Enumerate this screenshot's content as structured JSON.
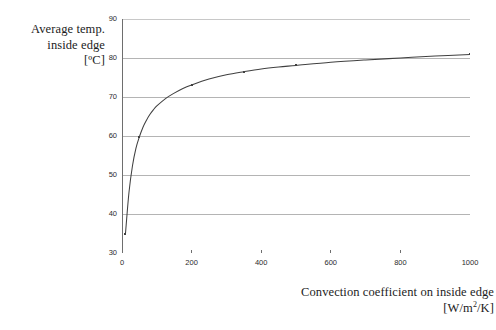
{
  "chart_data": {
    "type": "line",
    "title": "",
    "subtitle": "",
    "xlabel_lines": [
      "Convection coefficient on inside edge",
      "[W/m/K]"
    ],
    "xlabel_unit_numerator": "W/m",
    "xlabel_unit_exponent": "2",
    "xlabel_unit_denominator": "/K]",
    "ylabel_lines": [
      "Average temp.",
      "inside edge",
      "[ºC]"
    ],
    "xlim": [
      0,
      1000
    ],
    "ylim": [
      30,
      90
    ],
    "xticks": [
      0,
      200,
      400,
      600,
      800,
      1000
    ],
    "xtick_labels": [
      "0",
      "200",
      "400",
      "600",
      "800",
      "1000"
    ],
    "yticks": [
      30,
      40,
      50,
      60,
      70,
      80,
      90
    ],
    "ytick_labels": [
      "30",
      "40",
      "50",
      "60",
      "70",
      "80",
      "90"
    ],
    "grid": "horizontal",
    "legend": "none",
    "series": [
      {
        "name": "Average temp. inside edge",
        "color": "#404040",
        "marker": "small-dot",
        "x": [
          10,
          20,
          30,
          40,
          50,
          60,
          70,
          80,
          90,
          100,
          125,
          150,
          175,
          200,
          250,
          300,
          350,
          400,
          450,
          500,
          600,
          700,
          800,
          900,
          1000
        ],
        "y": [
          35.0,
          45.5,
          52.3,
          56.8,
          59.8,
          62.2,
          64.0,
          65.5,
          66.7,
          67.7,
          69.6,
          71.0,
          72.2,
          73.1,
          74.6,
          75.7,
          76.5,
          77.2,
          77.7,
          78.1,
          78.9,
          79.5,
          80.0,
          80.5,
          80.9
        ]
      }
    ],
    "annotations": []
  },
  "axes": {
    "y_title": {
      "line1": "Average temp.",
      "line2": "inside edge",
      "line3": "[ºC]"
    },
    "x_title": {
      "line1": "Convection coefficient on inside edge",
      "unit_prefix": "[W/m",
      "unit_sup": "2",
      "unit_suffix": "/K]"
    }
  },
  "style": {
    "background": "#ffffff",
    "grid_color": "#b4b4b4",
    "frame_color": "#c8c8c8",
    "axis_color": "#6e6e6e",
    "curve_color": "#404040",
    "text_color": "#1c1c1c"
  }
}
